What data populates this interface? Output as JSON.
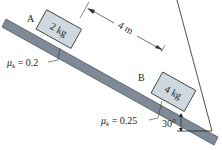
{
  "diagram": {
    "incline": {
      "angle_label": "30°",
      "fill": "#7f8a96",
      "edge": "#4f5862"
    },
    "block_a": {
      "label": "A",
      "mass": "2 kg",
      "fill": "#cfd8de"
    },
    "block_b": {
      "label": "B",
      "mass": "4 kg",
      "fill": "#cfd8de"
    },
    "distance": {
      "label": "4 m"
    },
    "friction_a": {
      "label": "μk = 0.2",
      "symbol": "μ",
      "sub": "k",
      "value": " = 0.2"
    },
    "friction_b": {
      "label": "μk = 0.25",
      "symbol": "μ",
      "sub": "k",
      "value": " = 0.25"
    }
  }
}
